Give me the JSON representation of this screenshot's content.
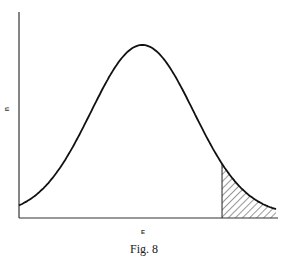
{
  "chart_data": {
    "type": "line",
    "title": "",
    "caption": "Fig. 8",
    "xlabel": "E",
    "ylabel": "n",
    "grid": false,
    "legend": "none",
    "series": [
      {
        "name": "distribution",
        "shape": "bell curve",
        "peak_x_fraction": 0.48,
        "peak_y_fraction": 0.84
      }
    ],
    "shaded_region": {
      "description": "hatched tail area under curve on right",
      "start_x_fraction": 0.79,
      "end_x_fraction": 1.0
    }
  },
  "caption": "Fig. 8",
  "axis": {
    "x_label": "E",
    "y_label": "n"
  }
}
